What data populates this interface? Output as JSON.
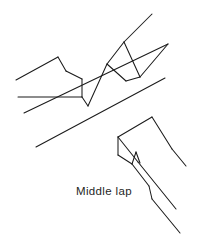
{
  "figure": {
    "caption": "Middle lap",
    "drawing_style": "line-art-isometric",
    "background_color": "#ffffff",
    "line_color": "#1b1b1b",
    "text_color": "#1f1f1f",
    "canvas": {
      "width": 198,
      "height": 250
    },
    "parts": [
      {
        "id": "upper-board",
        "label": "board with middle lap notch",
        "description": "Long board running diagonally from lower-left to upper-right with a rectangular lap recess cut across its middle"
      },
      {
        "id": "lower-board-end",
        "label": "board end with mating lap",
        "description": "End of a second board showing the mating half lap shoulder and cheek"
      }
    ]
  },
  "caption": {
    "text": "Middle lap"
  }
}
